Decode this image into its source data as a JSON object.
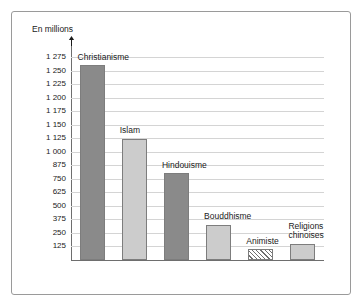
{
  "chart_data": {
    "type": "bar",
    "title": "",
    "ylabel": "En millions",
    "xlabel": "",
    "grid": true,
    "legend": "none",
    "ylim": [
      0,
      1275
    ],
    "categories": [
      "Christianisme",
      "Islam",
      "Hindouisme",
      "Bouddhisme",
      "Animiste",
      "Religions chinoises"
    ],
    "values": [
      1260,
      1120,
      800,
      325,
      100,
      150
    ],
    "ytick_labels": [
      "1 275",
      "1 250",
      "1 225",
      "1 200",
      "1 175",
      "1 150",
      "1 125",
      "1 000",
      "875",
      "750",
      "625",
      "500",
      "375",
      "250",
      "125"
    ],
    "ytick_values": [
      1275,
      1250,
      1225,
      1200,
      1175,
      1150,
      1125,
      1000,
      875,
      750,
      625,
      500,
      375,
      250,
      125
    ],
    "bars": [
      {
        "label": "Christianisme",
        "value": 1260,
        "style": "dark",
        "label_line2": ""
      },
      {
        "label": "Islam",
        "value": 1120,
        "style": "light",
        "label_line2": ""
      },
      {
        "label": "Hindouisme",
        "value": 800,
        "style": "dark",
        "label_line2": ""
      },
      {
        "label": "Bouddhisme",
        "value": 325,
        "style": "light",
        "label_line2": ""
      },
      {
        "label": "Animiste",
        "value": 100,
        "style": "hatch",
        "label_line2": ""
      },
      {
        "label": "Religions",
        "value": 150,
        "style": "light",
        "label_line2": "chinoises"
      }
    ],
    "colors": {
      "dark_bar": "#8a8a8a",
      "light_bar": "#cccccc",
      "hatch_stroke": "#6f6f6f",
      "gridline": "#d4d4d4",
      "axis": "#6e6e6e",
      "border": "#9a9a9a",
      "text": "#1a1a1a"
    }
  }
}
